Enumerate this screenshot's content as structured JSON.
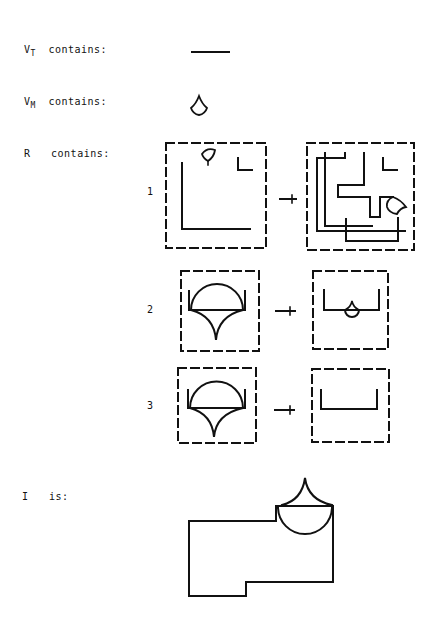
{
  "labels": {
    "vt": {
      "base": "V",
      "sub": "T",
      "text": "contains:"
    },
    "vm": {
      "base": "V",
      "sub": "M",
      "text": "contains:"
    },
    "r": {
      "base": "R",
      "text": "contains:"
    },
    "i": {
      "base": "I",
      "text": "is:"
    }
  },
  "rules": [
    {
      "number": "1"
    },
    {
      "number": "2"
    },
    {
      "number": "3"
    }
  ],
  "colors": {
    "ink": "#111111",
    "background": "#ffffff"
  }
}
